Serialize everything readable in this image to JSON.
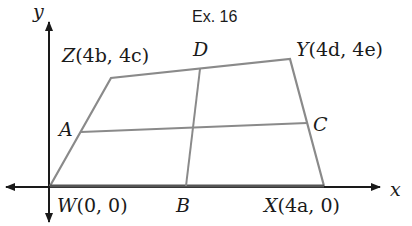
{
  "figure": {
    "title": "Ex. 16",
    "axes": {
      "x_label": "x",
      "y_label": "y"
    },
    "vertices": {
      "W": {
        "label": "W",
        "coords": "(0, 0)"
      },
      "X": {
        "label": "X",
        "coords": "(4a, 0)"
      },
      "Y": {
        "label": "Y",
        "coords": "(4d, 4e)"
      },
      "Z": {
        "label": "Z",
        "coords": "(4b, 4c)"
      }
    },
    "midpoints": {
      "A": "A",
      "B": "B",
      "C": "C",
      "D": "D"
    },
    "colors": {
      "axis": "#1a1a1a",
      "shape": "#8a8a8a",
      "base": "#555555"
    }
  }
}
